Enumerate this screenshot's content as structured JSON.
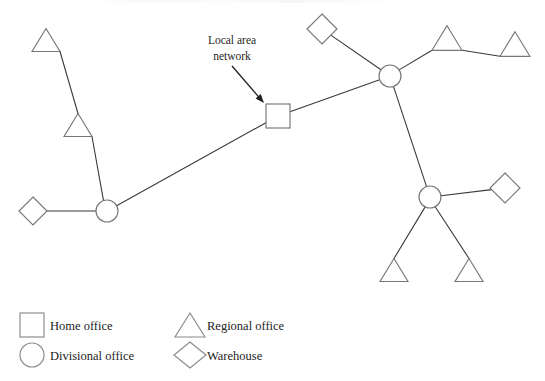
{
  "figure": {
    "type": "network-topology-diagram",
    "background_color": "#ffffff",
    "line_color": "#3a3a3a",
    "shape_stroke_color": "#777777",
    "shape_fill_color": "#ffffff"
  },
  "annotation": {
    "label_line1": "Local area",
    "label_line2": "network",
    "arrow": {
      "from_x": 232,
      "from_y": 66,
      "to_x": 264,
      "to_y": 103
    }
  },
  "nodes": [
    {
      "id": "lan-square",
      "kind": "home-office",
      "shape": "square",
      "x": 278,
      "y": 116,
      "size": 24
    },
    {
      "id": "divisional-left",
      "kind": "divisional-office",
      "shape": "circle",
      "x": 107,
      "y": 211,
      "size": 22
    },
    {
      "id": "divisional-ne",
      "kind": "divisional-office",
      "shape": "circle",
      "x": 390,
      "y": 76,
      "size": 22
    },
    {
      "id": "divisional-se",
      "kind": "divisional-office",
      "shape": "circle",
      "x": 430,
      "y": 197,
      "size": 22
    },
    {
      "id": "regional-far-nw",
      "kind": "regional-office",
      "shape": "triangle",
      "x": 46,
      "y": 40,
      "size": 28
    },
    {
      "id": "regional-mid-nw",
      "kind": "regional-office",
      "shape": "triangle",
      "x": 78,
      "y": 125,
      "size": 28
    },
    {
      "id": "regional-ne-a",
      "kind": "regional-office",
      "shape": "triangle",
      "x": 447,
      "y": 38,
      "size": 30
    },
    {
      "id": "regional-ne-b",
      "kind": "regional-office",
      "shape": "triangle",
      "x": 515,
      "y": 44,
      "size": 30
    },
    {
      "id": "regional-se-a",
      "kind": "regional-office",
      "shape": "triangle",
      "x": 394,
      "y": 270,
      "size": 28
    },
    {
      "id": "regional-se-b",
      "kind": "regional-office",
      "shape": "triangle",
      "x": 469,
      "y": 270,
      "size": 28
    },
    {
      "id": "warehouse-w",
      "kind": "warehouse",
      "shape": "diamond",
      "x": 33,
      "y": 211,
      "size": 28
    },
    {
      "id": "warehouse-n",
      "kind": "warehouse",
      "shape": "diamond",
      "x": 322,
      "y": 29,
      "size": 30
    },
    {
      "id": "warehouse-e",
      "kind": "warehouse",
      "shape": "diamond",
      "x": 505,
      "y": 188,
      "size": 30
    }
  ],
  "links": [
    {
      "from": "regional-far-nw",
      "to": "regional-mid-nw"
    },
    {
      "from": "regional-mid-nw",
      "to": "divisional-left"
    },
    {
      "from": "warehouse-w",
      "to": "divisional-left"
    },
    {
      "from": "divisional-left",
      "to": "lan-square"
    },
    {
      "from": "lan-square",
      "to": "divisional-ne"
    },
    {
      "from": "warehouse-n",
      "to": "divisional-ne"
    },
    {
      "from": "divisional-ne",
      "to": "regional-ne-a"
    },
    {
      "from": "regional-ne-a",
      "to": "regional-ne-b"
    },
    {
      "from": "divisional-ne",
      "to": "divisional-se"
    },
    {
      "from": "divisional-se",
      "to": "warehouse-e"
    },
    {
      "from": "divisional-se",
      "to": "regional-se-a"
    },
    {
      "from": "divisional-se",
      "to": "regional-se-b"
    }
  ],
  "legend": {
    "items": [
      {
        "shape": "square",
        "label": "Home office",
        "col": 0,
        "row": 0
      },
      {
        "shape": "circle",
        "label": "Divisional office",
        "col": 0,
        "row": 1
      },
      {
        "shape": "triangle",
        "label": "Regional office",
        "col": 1,
        "row": 0
      },
      {
        "shape": "diamond",
        "label": "Warehouse",
        "col": 1,
        "row": 1
      }
    ]
  }
}
